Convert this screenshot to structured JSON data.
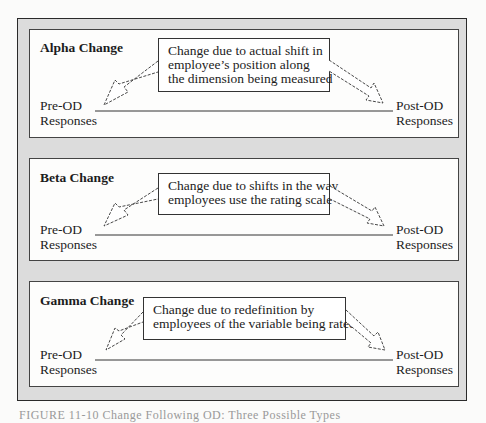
{
  "panels": [
    {
      "title": "Alpha Change",
      "callout": "Change due to actual shift in\nemployee’s position along\nthe dimension being measured",
      "left_label": "Pre-OD\nResponses",
      "right_label": "Post-OD\nResponses"
    },
    {
      "title": "Beta Change",
      "callout": "Change due to shifts in the way\nemployees use the rating scale",
      "left_label": "Pre-OD\nResponses",
      "right_label": "Post-OD\nResponses"
    },
    {
      "title": "Gamma Change",
      "callout": "Change due to redefinition by\nemployees of the variable being rated",
      "left_label": "Pre-OD\nResponses",
      "right_label": "Post-OD\nResponses"
    }
  ],
  "caption": "FIGURE 11-10 Change Following OD: Three Possible Types",
  "colors": {
    "frame_fill": "#dcdcdc",
    "panel_fill": "#fdfdfc",
    "line": "#333333"
  }
}
